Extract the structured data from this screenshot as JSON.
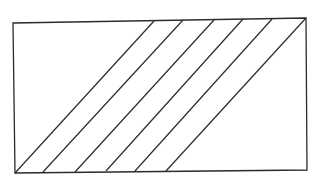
{
  "diagram": {
    "stroke_color": "#2b2b2b",
    "background": "#ffffff",
    "rectangle": {
      "corners": {
        "top_left": [
          13,
          23
        ],
        "top_right": [
          306,
          18
        ],
        "bottom_right": [
          307,
          170
        ],
        "bottom_left": [
          15,
          173
        ]
      }
    },
    "diagonal_lines": [
      {
        "from": [
          15,
          173
        ],
        "to": [
          154,
          21
        ]
      },
      {
        "from": [
          43,
          172
        ],
        "to": [
          183,
          20
        ]
      },
      {
        "from": [
          75,
          172
        ],
        "to": [
          214,
          20
        ]
      },
      {
        "from": [
          106,
          171
        ],
        "to": [
          243,
          19
        ]
      },
      {
        "from": [
          135,
          171
        ],
        "to": [
          272,
          19
        ]
      },
      {
        "from": [
          166,
          171
        ],
        "to": [
          306,
          18
        ]
      }
    ]
  }
}
